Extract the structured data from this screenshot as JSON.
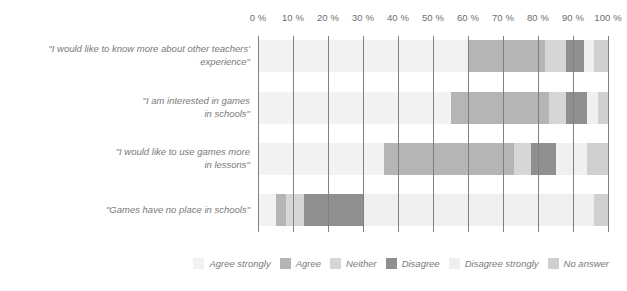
{
  "chart_data": {
    "type": "bar",
    "orientation": "horizontal",
    "stacked": true,
    "normalized_percent": true,
    "title": "",
    "subtitle": "",
    "xlabel": "",
    "ylabel": "",
    "xlim": [
      0,
      100
    ],
    "grid": true,
    "gridlines_axis": "x",
    "legend_position": "bottom-right",
    "xtick_labels": [
      "0 %",
      "10 %",
      "20 %",
      "30 %",
      "40 %",
      "50 %",
      "60 %",
      "70 %",
      "80 %",
      "90 %",
      "100 %"
    ],
    "xtick_values": [
      0,
      10,
      20,
      30,
      40,
      50,
      60,
      70,
      80,
      90,
      100
    ],
    "categories": [
      "\"I would like to know more about other teachers'\nexperience\"",
      "\"I am interested in games\nin schools\"",
      "\"I would like to use games more\nin lessons\"",
      "\"Games have no place in schools\""
    ],
    "series": [
      {
        "name": "Agree strongly",
        "color": "#f2f2f2",
        "values": [
          60,
          55,
          36,
          5
        ]
      },
      {
        "name": "Agree",
        "color": "#b5b5b5",
        "values": [
          22,
          28,
          37,
          3
        ]
      },
      {
        "name": "Neither",
        "color": "#d6d6d6",
        "values": [
          6,
          5,
          5,
          5
        ]
      },
      {
        "name": "Disagree",
        "color": "#8f8f8f",
        "values": [
          5,
          6,
          7,
          17
        ]
      },
      {
        "name": "Disagree strongly",
        "color": "#efefef",
        "values": [
          3,
          3,
          9,
          66
        ]
      },
      {
        "name": "No answer",
        "color": "#cfcfcf",
        "values": [
          4,
          3,
          6,
          4
        ]
      }
    ]
  },
  "legend": {
    "items": [
      {
        "label": "Agree strongly",
        "color": "#f2f2f2"
      },
      {
        "label": "Agree",
        "color": "#b5b5b5"
      },
      {
        "label": "Neither",
        "color": "#d6d6d6"
      },
      {
        "label": "Disagree",
        "color": "#8f8f8f"
      },
      {
        "label": "Disagree strongly",
        "color": "#efefef"
      },
      {
        "label": "No answer",
        "color": "#cfcfcf"
      }
    ]
  },
  "colors": {
    "gridline": "#808080",
    "tick": "#8d8d8d",
    "text": "#7a7a7a",
    "background": "#ffffff"
  }
}
